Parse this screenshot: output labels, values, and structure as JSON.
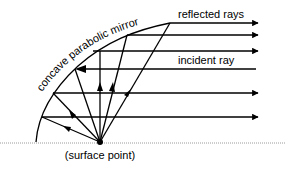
{
  "diagram": {
    "labels": {
      "mirror": "concave parabolic mirror",
      "reflected": "reflected rays",
      "incident": "incident ray",
      "surface_point": "(surface point)"
    },
    "colors": {
      "line": "#000000",
      "ground": "#9a9a9a",
      "background": "#ffffff"
    },
    "surface_point": {
      "x": 100,
      "y": 142
    },
    "ground_line_y": 143,
    "mirror_curve": [
      [
        36,
        142
      ],
      [
        42,
        117
      ],
      [
        53,
        93
      ],
      [
        74,
        69
      ],
      [
        90,
        51
      ],
      [
        127,
        35
      ],
      [
        170,
        23
      ]
    ],
    "reflected_rays_y": [
      23,
      35,
      51,
      93,
      117
    ],
    "incident_ray_y": 69,
    "ray_end_x": 258
  }
}
